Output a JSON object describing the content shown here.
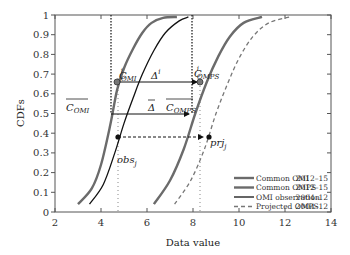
{
  "chart_data": {
    "type": "line",
    "title": "",
    "xlabel": "Data value",
    "ylabel": "CDFs",
    "xlim": [
      2,
      14
    ],
    "ylim": [
      0,
      1
    ],
    "xticks": [
      "2",
      "4",
      "6",
      "8",
      "10",
      "12",
      "14"
    ],
    "yticks": [
      "0",
      "0.1",
      "0.2",
      "0.3",
      "0.4",
      "0.5",
      "0.6",
      "0.7",
      "0.8",
      "0.9",
      "1"
    ],
    "grid": false,
    "legend_position": "lower right",
    "series": [
      {
        "name": "Common OMI",
        "period": "2012–15",
        "style": "thick gray solid",
        "x": [
          3.0,
          3.6,
          4.0,
          4.4,
          4.7,
          5.0,
          5.4,
          5.8,
          6.2,
          6.7,
          7.3
        ],
        "y": [
          0.04,
          0.12,
          0.24,
          0.44,
          0.62,
          0.73,
          0.83,
          0.91,
          0.96,
          0.985,
          0.99
        ]
      },
      {
        "name": "Common OMPS",
        "period": "2012–15",
        "style": "thick gray solid",
        "x": [
          6.3,
          7.0,
          7.6,
          8.1,
          8.6,
          9.1,
          9.6,
          10.2,
          11.0
        ],
        "y": [
          0.04,
          0.16,
          0.32,
          0.5,
          0.66,
          0.79,
          0.89,
          0.96,
          0.99
        ]
      },
      {
        "name": "OMI observation",
        "period": "2004–12",
        "style": "thin black solid",
        "x": [
          3.5,
          4.1,
          4.6,
          5.0,
          5.4,
          5.8,
          6.3,
          6.8,
          7.4,
          7.8
        ],
        "y": [
          0.04,
          0.14,
          0.3,
          0.45,
          0.58,
          0.7,
          0.82,
          0.91,
          0.97,
          0.99
        ]
      },
      {
        "name": "Projected OMPS",
        "period": "2004–12",
        "style": "gray dashed",
        "x": [
          7.2,
          7.9,
          8.5,
          9.0,
          9.5,
          10.0,
          10.6,
          11.3,
          12.2
        ],
        "y": [
          0.04,
          0.16,
          0.32,
          0.5,
          0.65,
          0.78,
          0.89,
          0.96,
          0.99
        ]
      }
    ],
    "annotations": [
      {
        "label": "C^i_OMI",
        "x": 4.8,
        "y": 0.67
      },
      {
        "label": "C^i_OMPS",
        "x": 8.6,
        "y": 0.67
      },
      {
        "label": "Δ^i",
        "x": 6.6,
        "y": 0.69
      },
      {
        "label": "C̄_OMI",
        "x": 3.5,
        "y": 0.52
      },
      {
        "label": "Δ̄",
        "x": 6.3,
        "y": 0.52
      },
      {
        "label": "C̄_OMPS",
        "x": 7.3,
        "y": 0.55
      },
      {
        "label": "obs_j",
        "x": 4.8,
        "y": 0.38
      },
      {
        "label": "prj_j",
        "x": 8.9,
        "y": 0.38
      }
    ],
    "reference_lines": {
      "vertical_dotted_x": [
        4.48,
        7.98,
        4.8,
        8.5
      ],
      "horizontal_arrows": [
        {
          "from_x": 4.7,
          "to_x": 8.5,
          "y": 0.67,
          "style": "solid"
        },
        {
          "from_x": 4.48,
          "to_x": 7.98,
          "y": 0.5,
          "style": "solid"
        },
        {
          "from_x": 4.8,
          "to_x": 8.75,
          "y": 0.38,
          "style": "dashed"
        }
      ]
    }
  },
  "labels": {
    "xlabel": "Data value",
    "ylabel": "CDFs",
    "ann_c_omi": "C",
    "ann_c_omi_sup": "i",
    "ann_c_omi_sub": "OMI",
    "ann_c_omps": "C",
    "ann_c_omps_sup": "i",
    "ann_c_omps_sub": "OMPS",
    "ann_delta_i": "Δ",
    "ann_delta_i_sup": "i",
    "ann_cbar_omi": "C",
    "ann_cbar_omi_sub": "OMI",
    "ann_delta_bar": "Δ",
    "ann_cbar_omps": "C",
    "ann_cbar_omps_sub": "OMPS",
    "ann_obs": "obs",
    "ann_obs_sub": "j",
    "ann_prj": "prj",
    "ann_prj_sub": "j"
  },
  "legend": [
    {
      "name": "Common OMI",
      "period": "2012–15"
    },
    {
      "name": "Common OMPS",
      "period": "2012–15"
    },
    {
      "name": "OMI observation",
      "period": "2004–12"
    },
    {
      "name": "Projected OMPS",
      "period": "2004–12"
    }
  ],
  "colors": {
    "common": "#6b6b6b",
    "omi_obs": "#111111",
    "projected": "#777777",
    "axis": "#555555"
  }
}
